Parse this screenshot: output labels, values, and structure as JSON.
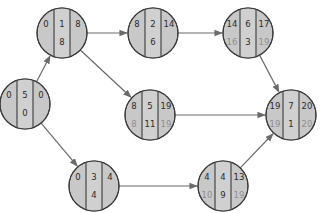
{
  "diagram": {
    "type": "activity-on-node network",
    "colors": {
      "node_fill": "#c8c8c8",
      "node_stroke": "#3a3a3a",
      "edge": "#6a6a6a",
      "text": "#2a2a2a",
      "faded_text": "#8e8e8e"
    },
    "nodes": [
      {
        "id": "A",
        "cx": 25,
        "cy": 104,
        "es": "0",
        "dur": "5",
        "ef": "0",
        "ls": "",
        "slack": "0",
        "lf": ""
      },
      {
        "id": "B",
        "cx": 62,
        "cy": 33,
        "es": "0",
        "dur": "1",
        "ef": "8",
        "ls": "",
        "slack": "8",
        "lf": ""
      },
      {
        "id": "C",
        "cx": 153,
        "cy": 33,
        "es": "8",
        "dur": "2",
        "ef": "14",
        "ls": "",
        "slack": "6",
        "lf": ""
      },
      {
        "id": "D",
        "cx": 248,
        "cy": 33,
        "es": "14",
        "dur": "6",
        "ef": "17",
        "ls": "16",
        "slack": "3",
        "lf": "19"
      },
      {
        "id": "E",
        "cx": 150,
        "cy": 115,
        "es": "8",
        "dur": "5",
        "ef": "19",
        "ls": "8",
        "slack": "11",
        "lf": "19"
      },
      {
        "id": "F",
        "cx": 291,
        "cy": 115,
        "es": "19",
        "dur": "7",
        "ef": "20",
        "ls": "19",
        "slack": "1",
        "lf": "20"
      },
      {
        "id": "G",
        "cx": 94,
        "cy": 186,
        "es": "0",
        "dur": "3",
        "ef": "4",
        "ls": "",
        "slack": "4",
        "lf": ""
      },
      {
        "id": "H",
        "cx": 223,
        "cy": 186,
        "es": "4",
        "dur": "4",
        "ef": "13",
        "ls": "10",
        "slack": "9",
        "lf": "19"
      }
    ],
    "edges": [
      {
        "from": "A",
        "to": "B"
      },
      {
        "from": "A",
        "to": "G"
      },
      {
        "from": "B",
        "to": "C"
      },
      {
        "from": "B",
        "to": "E"
      },
      {
        "from": "C",
        "to": "D"
      },
      {
        "from": "D",
        "to": "F"
      },
      {
        "from": "E",
        "to": "F"
      },
      {
        "from": "G",
        "to": "H"
      },
      {
        "from": "H",
        "to": "F"
      }
    ]
  }
}
